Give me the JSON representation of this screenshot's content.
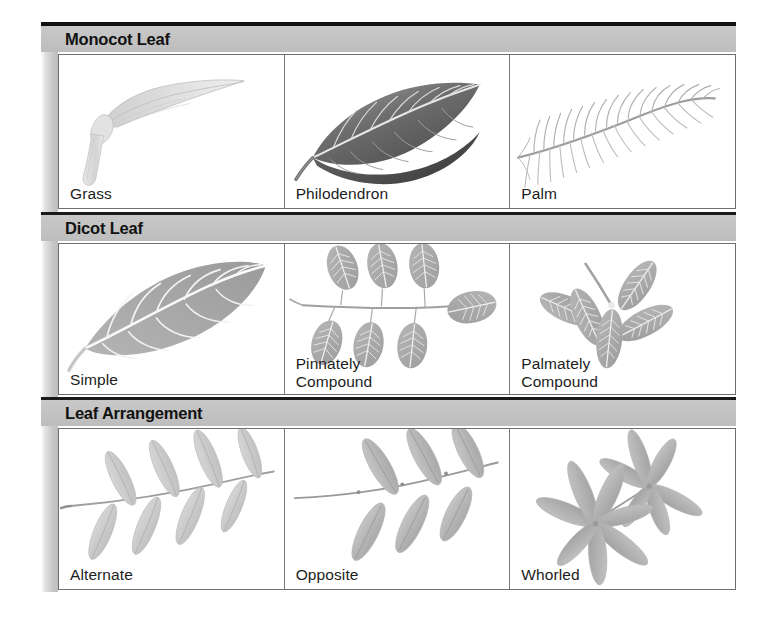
{
  "figure": {
    "sections": [
      {
        "id": "monocot",
        "title": "Monocot Leaf",
        "cells": [
          {
            "caption": "Grass",
            "art": "grass-leaf-illustration"
          },
          {
            "caption": "Philodendron",
            "art": "philodendron-leaf-illustration"
          },
          {
            "caption": "Palm",
            "art": "palm-frond-illustration"
          }
        ]
      },
      {
        "id": "dicot",
        "title": "Dicot Leaf",
        "cells": [
          {
            "caption": "Simple",
            "art": "simple-leaf-illustration"
          },
          {
            "caption": "Pinnately\nCompound",
            "art": "pinnately-compound-leaf-illustration"
          },
          {
            "caption": "Palmately\nCompound",
            "art": "palmately-compound-leaf-illustration"
          }
        ]
      },
      {
        "id": "arrangement",
        "title": "Leaf Arrangement",
        "cells": [
          {
            "caption": "Alternate",
            "art": "alternate-leaf-arrangement-illustration"
          },
          {
            "caption": "Opposite",
            "art": "opposite-leaf-arrangement-illustration"
          },
          {
            "caption": "Whorled",
            "art": "whorled-leaf-arrangement-illustration"
          }
        ]
      }
    ],
    "colors": {
      "header_band": "#c2c2c2",
      "rule": "#111111",
      "cell_border": "#6f6f6f",
      "text": "#1d1d1d",
      "background": "#ffffff"
    }
  }
}
